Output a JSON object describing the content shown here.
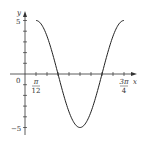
{
  "chart_data": {
    "type": "line",
    "title": "",
    "function": "y = 5 cos(3(x - pi/12))",
    "xlabel": "x",
    "ylabel": "y",
    "origin_label": "0",
    "x_tick_labels": [
      {
        "num": "π",
        "den": "12",
        "value": 0.2618
      },
      {
        "num": "3π",
        "den": "4",
        "value": 2.3562
      }
    ],
    "y_tick_labels": [
      {
        "label": "5",
        "value": 5
      },
      {
        "label": "−5",
        "value": -5
      }
    ],
    "x_ticks_step": "π/12",
    "x_ticks": [
      0.2618,
      0.5236,
      0.7854,
      1.0472,
      1.309,
      1.5708,
      1.8326,
      2.0944,
      2.3562
    ],
    "y_ticks": [
      -5,
      -4,
      -3,
      -2,
      -1,
      1,
      2,
      3,
      4,
      5
    ],
    "xlim": [
      0,
      2.3562
    ],
    "ylim": [
      -5,
      5
    ],
    "grid": false,
    "legend": null,
    "series": [
      {
        "name": "curve",
        "x": [
          0.2618,
          0.5236,
          0.7854,
          1.0472,
          1.309,
          1.5708,
          1.8326,
          2.0944,
          2.3562
        ],
        "values": [
          5,
          0,
          -5,
          0,
          5,
          0,
          -5,
          0,
          5
        ],
        "key_points": [
          {
            "x": "π/12",
            "y": 5
          },
          {
            "x": "π/4",
            "y": 0
          },
          {
            "x": "5π/12",
            "y": -5
          },
          {
            "x": "7π/12",
            "y": 0
          },
          {
            "x": "3π/4",
            "y": 5
          }
        ]
      }
    ],
    "color": "#222222"
  }
}
